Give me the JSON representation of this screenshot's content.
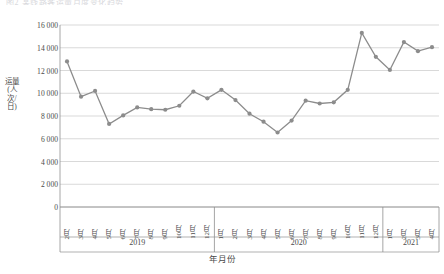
{
  "title_clipped": "图2 某线路客运量月度变化趋势",
  "axis": {
    "y_title": "运量(人次/日)",
    "x_title": "年月份",
    "y_ticks": [
      "0",
      "2 000",
      "4 000",
      "6 000",
      "8 000",
      "10 000",
      "12 000",
      "14 000",
      "16 000"
    ],
    "y_min": 0,
    "y_max": 16000,
    "y_step": 2000
  },
  "groups": [
    {
      "label": "2019",
      "count": 11
    },
    {
      "label": "2020",
      "count": 12
    },
    {
      "label": "2021",
      "count": 4
    }
  ],
  "style": {
    "line_color": "#8c8c8c",
    "marker_color": "#8c8c8c",
    "grid_color": "#c9c9c9",
    "axis_color": "#8f8f8f",
    "text_color": "#4a4a4a"
  },
  "chart_data": {
    "type": "line",
    "title": "图2 某线路客运量月度变化趋势",
    "xlabel": "年月份",
    "ylabel": "运量(人次/日)",
    "ylim": [
      0,
      16000
    ],
    "ytick_step": 2000,
    "grid": true,
    "legend": "none",
    "markers": true,
    "categories": [
      "2月",
      "3月",
      "4月",
      "5月",
      "6月",
      "7月",
      "8月",
      "9月",
      "10月",
      "11月",
      "12月",
      "1月",
      "2月",
      "3月",
      "4月",
      "5月",
      "6月",
      "7月",
      "8月",
      "9月",
      "10月",
      "11月",
      "12月",
      "1月",
      "2月",
      "3月",
      "4月"
    ],
    "x_full": [
      "2019-02",
      "2019-03",
      "2019-04",
      "2019-05",
      "2019-06",
      "2019-07",
      "2019-08",
      "2019-09",
      "2019-10",
      "2019-11",
      "2019-12",
      "2020-01",
      "2020-02",
      "2020-03",
      "2020-04",
      "2020-05",
      "2020-06",
      "2020-07",
      "2020-08",
      "2020-09",
      "2020-10",
      "2020-11",
      "2020-12",
      "2021-01",
      "2021-02",
      "2021-03",
      "2021-04"
    ],
    "values": [
      12800,
      9700,
      10200,
      7300,
      8050,
      8750,
      8600,
      8550,
      8900,
      10150,
      9550,
      10300,
      9400,
      8200,
      7500,
      6550,
      7600,
      9350,
      9100,
      9200,
      10300,
      15300,
      13200,
      12050,
      14500,
      13700,
      14050
    ]
  }
}
